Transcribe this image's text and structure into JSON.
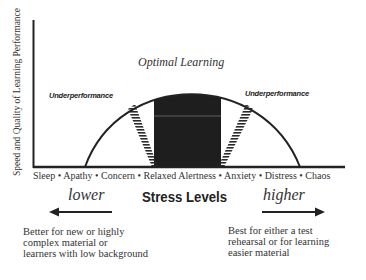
{
  "diagram": {
    "y_axis_label": "Speed and Quality of Learning Performance",
    "curve_title": "Optimal Learning",
    "region_labels": {
      "left": "Underperformance",
      "right": "Underperformance"
    },
    "stress_scale": "Sleep • Apathy •  Concern •  Relaxed Alertness •  Anxiety • Distress • Chaos",
    "stress_scale_items": [
      "Sleep",
      "Apathy",
      "Concern",
      "Relaxed Alertness",
      "Anxiety",
      "Distress",
      "Chaos"
    ],
    "x_axis_title": "Stress Levels",
    "direction_left": {
      "label": "lower",
      "arrow": "left-arrow-icon",
      "note": "Better for new or highly\ncomplex material or\nlearners with low background"
    },
    "direction_right": {
      "label": "higher",
      "arrow": "right-arrow-icon",
      "note": "Best for either a test\nrehearsal or for learning\neasier material"
    },
    "colors": {
      "ink": "#222222",
      "optimal_block": "#1e1e1e",
      "background": "#ffffff"
    }
  }
}
